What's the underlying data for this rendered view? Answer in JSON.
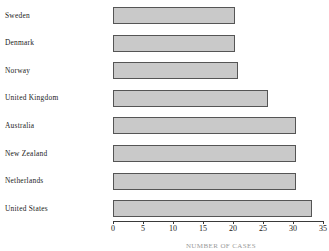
{
  "chart_data": {
    "type": "bar",
    "orientation": "horizontal",
    "title": "",
    "xlabel": "",
    "ylabel": "",
    "xlim": [
      0,
      35
    ],
    "grid": false,
    "legend": null,
    "categories": [
      "Sweden",
      "Denmark",
      "Norway",
      "United Kingdom",
      "Australia",
      "New Zealand",
      "Netherlands",
      "United States"
    ],
    "values": [
      20.3,
      20.4,
      20.8,
      25.9,
      30.5,
      30.5,
      30.5,
      33.2
    ],
    "xticks": [
      0,
      5,
      10,
      15,
      20,
      25,
      30,
      35
    ],
    "xtick_labels": [
      "0",
      "5",
      "10",
      "15",
      "20",
      "25",
      "30",
      "35"
    ],
    "bar_fill_color": "#c9c9c9",
    "bar_border_color": "#555555",
    "background_color": "#ffffff"
  },
  "caption": {
    "text": "NUMBER OF CASES"
  }
}
